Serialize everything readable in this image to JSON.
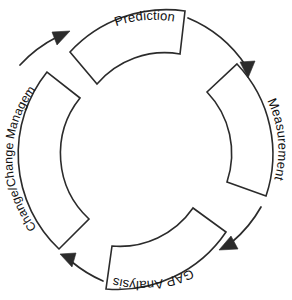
{
  "diagram": {
    "type": "cycle",
    "direction": "clockwise",
    "background_color": "#ffffff",
    "stroke_color": "#2b2b2b",
    "text_color": "#111111",
    "segments": [
      {
        "id": "prediction",
        "label": "Prediction",
        "position": "top",
        "order": 1
      },
      {
        "id": "measurement",
        "label": "Measurement",
        "position": "right",
        "order": 2
      },
      {
        "id": "gap-analysis",
        "label": "GAP Analysis",
        "position": "bottom",
        "order": 3
      },
      {
        "id": "change-management",
        "label": "Change/Change Management",
        "position": "left",
        "order": 4
      }
    ],
    "arrows": [
      {
        "id": "arrow-prediction-to-measurement",
        "from": "prediction",
        "to": "measurement"
      },
      {
        "id": "arrow-measurement-to-gap-analysis",
        "from": "measurement",
        "to": "gap-analysis"
      },
      {
        "id": "arrow-gap-analysis-to-change-management",
        "from": "gap-analysis",
        "to": "change-management"
      },
      {
        "id": "arrow-change-management-to-prediction",
        "from": "change-management",
        "to": "prediction"
      }
    ]
  }
}
